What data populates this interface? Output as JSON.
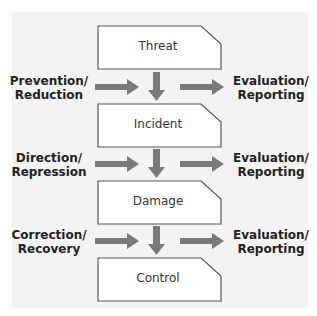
{
  "nodes": [
    {
      "id": "threat",
      "label": "Threat"
    },
    {
      "id": "incident",
      "label": "Incident"
    },
    {
      "id": "damage",
      "label": "Damage"
    },
    {
      "id": "control",
      "label": "Control"
    }
  ],
  "stages": [
    {
      "left_label_1": "Prevention/",
      "left_label_2": "Reduction",
      "right_label_1": "Evaluation/",
      "right_label_2": "Reporting"
    },
    {
      "left_label_1": "Direction/",
      "left_label_2": "Repression",
      "right_label_1": "Evaluation/",
      "right_label_2": "Reporting"
    },
    {
      "left_label_1": "Correction/",
      "left_label_2": "Recovery",
      "right_label_1": "Evaluation/",
      "right_label_2": "Reporting"
    }
  ],
  "colors": {
    "arrow": "#7a7a7a",
    "box_border": "#555555",
    "panel": "#f3f3f3"
  }
}
